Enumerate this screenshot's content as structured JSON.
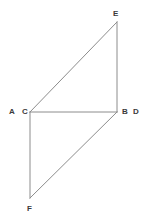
{
  "figure": {
    "background_color": "#ffffff",
    "stroke_color": "#8c8c8c",
    "stroke_width": 1,
    "label_color": "#3a3a3a",
    "width": 148,
    "height": 223,
    "points": [
      {
        "id": "E",
        "label": "E",
        "x": 117,
        "y": 22,
        "label_x": 113,
        "label_y": 10
      },
      {
        "id": "A",
        "label": "A",
        "x": 30,
        "y": 112,
        "label_x": 9,
        "label_y": 108
      },
      {
        "id": "C",
        "label": "C",
        "x": 30,
        "y": 112,
        "label_x": 22,
        "label_y": 108
      },
      {
        "id": "B",
        "label": "B",
        "x": 117,
        "y": 112,
        "label_x": 122,
        "label_y": 108
      },
      {
        "id": "D",
        "label": "D",
        "x": 117,
        "y": 112,
        "label_x": 133,
        "label_y": 108
      },
      {
        "id": "F",
        "label": "F",
        "x": 30,
        "y": 198,
        "label_x": 27,
        "label_y": 205
      }
    ],
    "segments": [
      {
        "id": "C-E",
        "from": "C",
        "to": "E",
        "x1": 30,
        "y1": 112,
        "x2": 117,
        "y2": 22
      },
      {
        "id": "E-B",
        "from": "E",
        "to": "B",
        "x1": 117,
        "y1": 22,
        "x2": 117,
        "y2": 112
      },
      {
        "id": "C-B",
        "from": "C",
        "to": "B",
        "x1": 30,
        "y1": 112,
        "x2": 117,
        "y2": 112
      },
      {
        "id": "C-F",
        "from": "C",
        "to": "F",
        "x1": 30,
        "y1": 112,
        "x2": 30,
        "y2": 198
      },
      {
        "id": "F-B",
        "from": "F",
        "to": "B",
        "x1": 30,
        "y1": 198,
        "x2": 117,
        "y2": 112
      }
    ]
  }
}
